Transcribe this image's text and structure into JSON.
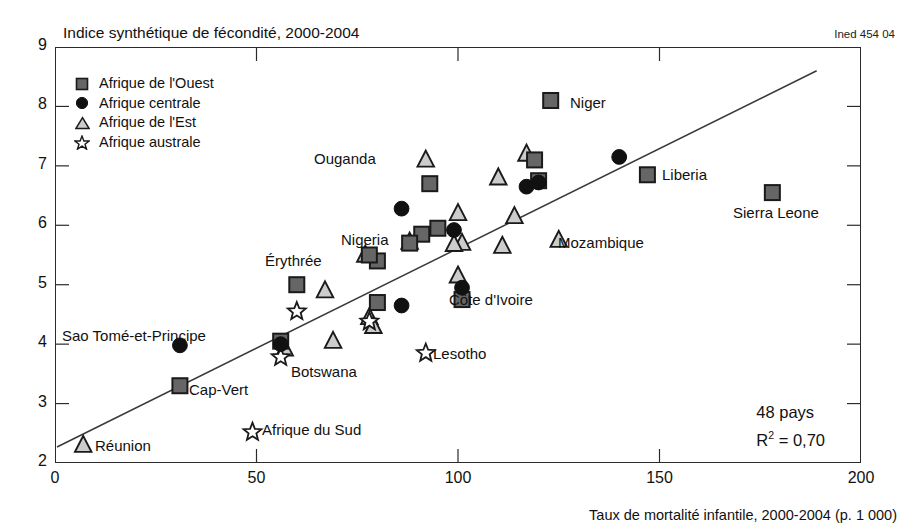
{
  "title": "Indice synthétique de fécondité, 2000-2004",
  "source_code": "Ined 454 04",
  "xaxis_title": "Taux de mortalité infantile, 2000-2004 (p. 1 000)",
  "stats": {
    "countries": "48 pays",
    "r2_prefix": "R",
    "r2_sup": "2",
    "r2_value": " = 0,70"
  },
  "legend": {
    "items": [
      {
        "label": "Afrique de l'Ouest",
        "marker": "square",
        "icon": "filled-square-icon"
      },
      {
        "label": "Afrique centrale",
        "marker": "circle",
        "icon": "filled-circle-icon"
      },
      {
        "label": "Afrique de l'Est",
        "marker": "triangle",
        "icon": "triangle-icon"
      },
      {
        "label": "Afrique australe",
        "marker": "star",
        "icon": "star-outline-icon"
      }
    ]
  },
  "chart_data": {
    "type": "scatter",
    "title": "Indice synthétique de fécondité, 2000-2004",
    "xlabel": "Taux de mortalité infantile, 2000-2004 (p. 1 000)",
    "ylabel": "Indice synthétique de fécondité, 2000-2004",
    "xlim": [
      0,
      200
    ],
    "ylim": [
      2,
      9
    ],
    "xticks": [
      0,
      50,
      100,
      150,
      200
    ],
    "yticks": [
      2,
      3,
      4,
      5,
      6,
      7,
      8,
      9
    ],
    "grid": false,
    "legend_position": "top-left",
    "annotations": [
      "48 pays",
      "R2 = 0,70",
      "Ined 454 04"
    ],
    "trendline": {
      "x0": 0.5,
      "y0": 2.27,
      "x1": 189,
      "y1": 8.6,
      "r2": 0.7
    },
    "colors": {
      "square_fill": "#666666",
      "circle_fill": "#111111",
      "triangle_fill": "#cccccc",
      "star_fill": "#ffffff",
      "marker_stroke": "#1a1a1a",
      "axis": "#2b2b2b"
    },
    "series": [
      {
        "name": "Afrique de l'Ouest",
        "marker": "square",
        "points": [
          {
            "x": 123,
            "y": 8.1,
            "label": "Niger",
            "label_pos": "right"
          },
          {
            "x": 147,
            "y": 6.85,
            "label": "Liberia",
            "label_pos": "right"
          },
          {
            "x": 178,
            "y": 6.55,
            "label": "Sierra Leone",
            "label_pos": "below"
          },
          {
            "x": 119,
            "y": 7.1,
            "label": null
          },
          {
            "x": 93,
            "y": 6.7,
            "label": null
          },
          {
            "x": 120,
            "y": 6.75,
            "label": null
          },
          {
            "x": 60,
            "y": 5.0,
            "label": null
          },
          {
            "x": 80,
            "y": 5.4,
            "label": "Nigeria",
            "label_pos": "above-left"
          },
          {
            "x": 78,
            "y": 5.5,
            "label": null
          },
          {
            "x": 91,
            "y": 5.85,
            "label": null
          },
          {
            "x": 95,
            "y": 5.95,
            "label": null
          },
          {
            "x": 80,
            "y": 4.7,
            "label": null
          },
          {
            "x": 101,
            "y": 4.75,
            "label": "Côte d'Ivoire",
            "label_pos": "right"
          },
          {
            "x": 56,
            "y": 4.05,
            "label": null
          },
          {
            "x": 31,
            "y": 3.3,
            "label": "Cap-Vert",
            "label_pos": "right"
          },
          {
            "x": 88,
            "y": 5.7,
            "label": null
          }
        ]
      },
      {
        "name": "Afrique centrale",
        "marker": "circle",
        "points": [
          {
            "x": 140,
            "y": 7.15,
            "label": null
          },
          {
            "x": 117,
            "y": 6.65,
            "label": null
          },
          {
            "x": 120,
            "y": 6.72,
            "label": null
          },
          {
            "x": 86,
            "y": 6.28,
            "label": null
          },
          {
            "x": 99,
            "y": 5.92,
            "label": null
          },
          {
            "x": 101,
            "y": 4.95,
            "label": null
          },
          {
            "x": 86,
            "y": 4.65,
            "label": null
          },
          {
            "x": 31,
            "y": 3.98,
            "label": "Sao Tomé-et-Principe",
            "label_pos": "left"
          },
          {
            "x": 56,
            "y": 4.0,
            "label": null
          }
        ]
      },
      {
        "name": "Afrique de l'Est",
        "marker": "triangle",
        "points": [
          {
            "x": 92,
            "y": 7.1,
            "label": "Ouganda",
            "label_pos": "left"
          },
          {
            "x": 117,
            "y": 7.2,
            "label": null
          },
          {
            "x": 110,
            "y": 6.8,
            "label": null
          },
          {
            "x": 114,
            "y": 6.15,
            "label": null
          },
          {
            "x": 100,
            "y": 6.2,
            "label": null
          },
          {
            "x": 111,
            "y": 5.65,
            "label": null
          },
          {
            "x": 125,
            "y": 5.75,
            "label": "Mozambique",
            "label_pos": "right"
          },
          {
            "x": 77,
            "y": 5.5,
            "label": "Érythrée",
            "label_pos": "left"
          },
          {
            "x": 100,
            "y": 5.15,
            "label": null
          },
          {
            "x": 101,
            "y": 5.7,
            "label": null
          },
          {
            "x": 99,
            "y": 5.68,
            "label": null
          },
          {
            "x": 67,
            "y": 4.9,
            "label": null
          },
          {
            "x": 69,
            "y": 4.05,
            "label": null
          },
          {
            "x": 78,
            "y": 4.45,
            "label": null
          },
          {
            "x": 79,
            "y": 4.3,
            "label": null
          },
          {
            "x": 57,
            "y": 3.92,
            "label": null
          },
          {
            "x": 7,
            "y": 2.3,
            "label": "Réunion",
            "label_pos": "right"
          },
          {
            "x": 88,
            "y": 5.72,
            "label": null
          }
        ]
      },
      {
        "name": "Afrique australe",
        "marker": "star",
        "points": [
          {
            "x": 60,
            "y": 4.55,
            "label": null
          },
          {
            "x": 78,
            "y": 4.38,
            "label": null
          },
          {
            "x": 56,
            "y": 3.78,
            "label": "Botswana",
            "label_pos": "below-right"
          },
          {
            "x": 92,
            "y": 3.85,
            "label": "Lesotho",
            "label_pos": "right"
          },
          {
            "x": 49,
            "y": 2.52,
            "label": "Afrique du Sud",
            "label_pos": "right"
          }
        ]
      }
    ]
  },
  "point_labels": [
    {
      "text": "Niger",
      "x": 570,
      "y": 94
    },
    {
      "text": "Liberia",
      "x": 662,
      "y": 166
    },
    {
      "text": "Sierra Leone",
      "x": 733,
      "y": 204
    },
    {
      "text": "Mozambique",
      "x": 558,
      "y": 234
    },
    {
      "text": "Ouganda",
      "x": 314,
      "y": 150
    },
    {
      "text": "Nigeria",
      "x": 341,
      "y": 231
    },
    {
      "text": "Érythrée",
      "x": 265,
      "y": 252
    },
    {
      "text": "Côte d'Ivoire",
      "x": 449,
      "y": 291
    },
    {
      "text": "Sao Tomé-et-Principe",
      "x": 62,
      "y": 327
    },
    {
      "text": "Cap-Vert",
      "x": 189,
      "y": 381
    },
    {
      "text": "Botswana",
      "x": 291,
      "y": 363
    },
    {
      "text": "Lesotho",
      "x": 433,
      "y": 345
    },
    {
      "text": "Afrique du Sud",
      "x": 262,
      "y": 421
    },
    {
      "text": "Réunion",
      "x": 95,
      "y": 437
    }
  ],
  "y_tick_labels": [
    "9",
    "8",
    "7",
    "6",
    "5",
    "4",
    "3",
    "2"
  ],
  "x_tick_labels": [
    "0",
    "50",
    "100",
    "150",
    "200"
  ]
}
